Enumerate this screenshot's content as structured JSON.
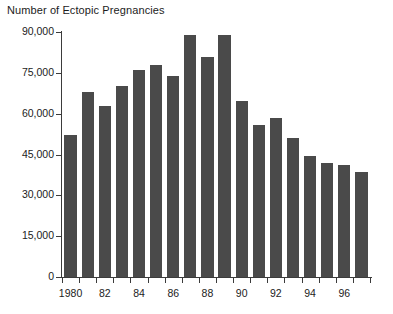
{
  "chart_data": {
    "type": "bar",
    "title": "Number of Ectopic Pregnancies",
    "xlabel": "",
    "ylabel": "",
    "ylim": [
      0,
      90000
    ],
    "ytick_values": [
      0,
      15000,
      30000,
      45000,
      60000,
      75000,
      90000
    ],
    "ytick_labels": [
      "0",
      "15,000",
      "30,000",
      "45,000",
      "60,000",
      "75,000",
      "90,000"
    ],
    "grid": false,
    "legend": false,
    "bar_color": "#4a4a4a",
    "axis_color": "#3b3b3b",
    "categories": [
      "1980",
      "1981",
      "1982",
      "1983",
      "1984",
      "1985",
      "1986",
      "1987",
      "1988",
      "1989",
      "1990",
      "1991",
      "1992",
      "1993",
      "1994",
      "1995",
      "1996",
      "1997"
    ],
    "xtick_labels": [
      "1980",
      "",
      "82",
      "",
      "84",
      "",
      "86",
      "",
      "88",
      "",
      "90",
      "",
      "92",
      "",
      "94",
      "",
      "96",
      ""
    ],
    "values": [
      52000,
      68000,
      63000,
      70000,
      76000,
      78000,
      74000,
      89000,
      81000,
      89000,
      64500,
      56000,
      58500,
      51000,
      44500,
      42000,
      41000,
      38500
    ]
  }
}
